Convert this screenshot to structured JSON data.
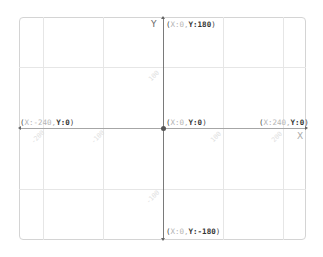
{
  "diagram": {
    "type": "xy-grid",
    "axes": {
      "x_label": "X",
      "y_label": "Y",
      "x_range": [
        -240,
        240
      ],
      "y_range": [
        -180,
        180
      ]
    },
    "coordinates": {
      "top": {
        "open": "(",
        "x": "X:0,",
        "y": "Y:180",
        "close": ")"
      },
      "origin": {
        "open": "(",
        "x": "X:0,",
        "y": "Y:0",
        "close": ")"
      },
      "left": {
        "open": "(",
        "x": "X:-240,",
        "y": "Y:0",
        "close": ")"
      },
      "right": {
        "open": "(",
        "x": "X:240,",
        "y": "Y:0",
        "close": ")"
      },
      "bottom": {
        "open": "(",
        "x": "X:0,",
        "y": "Y:-180",
        "close": ")"
      }
    },
    "ticks": {
      "y_pos": "100",
      "y_neg": "-100",
      "x_neg_200": "-200",
      "x_neg_100": "-100",
      "x_pos_100": "100",
      "x_pos_200": "200"
    },
    "colors": {
      "grid": "#e6e6e6",
      "axis": "#7a7a7a",
      "border": "#d4d4d4",
      "label_dim": "#b5b5b5",
      "label_bold": "#333333"
    }
  }
}
